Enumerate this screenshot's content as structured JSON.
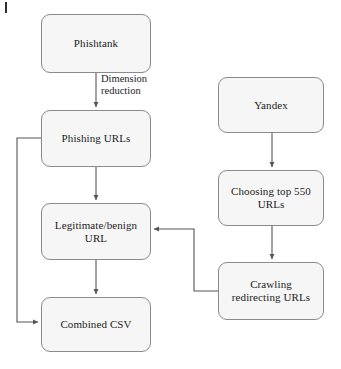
{
  "diagram": {
    "style": {
      "node_fill": "#f6f6f6",
      "node_border": "#8a8a8a",
      "edge_color": "#555555",
      "text_color": "#1c1c1c"
    },
    "nodes": [
      {
        "id": "phishtank",
        "label": "Phishtank",
        "x": 41,
        "y": 14,
        "w": 110,
        "h": 59
      },
      {
        "id": "phishing_urls",
        "label": "Phishing URLs",
        "x": 41,
        "y": 110,
        "w": 110,
        "h": 57
      },
      {
        "id": "legit_url",
        "label": "Legitimate/benign\nURL",
        "x": 41,
        "y": 203,
        "w": 110,
        "h": 57
      },
      {
        "id": "combined_csv",
        "label": "Combined CSV",
        "x": 41,
        "y": 297,
        "w": 110,
        "h": 55
      },
      {
        "id": "yandex",
        "label": "Yandex",
        "x": 218,
        "y": 77,
        "w": 106,
        "h": 56
      },
      {
        "id": "choosing",
        "label": "Choosing top 550\nURLs",
        "x": 218,
        "y": 170,
        "w": 106,
        "h": 56
      },
      {
        "id": "crawling",
        "label": "Crawling\nredirecting URLs",
        "x": 218,
        "y": 262,
        "w": 106,
        "h": 58
      }
    ],
    "edge_labels": [
      {
        "id": "dimension_reduction",
        "text": "Dimension\nreduction",
        "x": 101,
        "y": 73
      }
    ],
    "edges": [
      {
        "id": "phishtank-to-phishing",
        "from": "phishtank",
        "to": "phishing_urls"
      },
      {
        "id": "phishing-to-legit",
        "from": "phishing_urls",
        "to": "legit_url"
      },
      {
        "id": "legit-to-combined",
        "from": "legit_url",
        "to": "combined_csv"
      },
      {
        "id": "phishing-to-combined",
        "from": "phishing_urls",
        "to": "combined_csv"
      },
      {
        "id": "yandex-to-choosing",
        "from": "yandex",
        "to": "choosing"
      },
      {
        "id": "choosing-to-crawling",
        "from": "choosing",
        "to": "crawling"
      },
      {
        "id": "crawling-to-legit",
        "from": "crawling",
        "to": "legit_url"
      }
    ]
  }
}
